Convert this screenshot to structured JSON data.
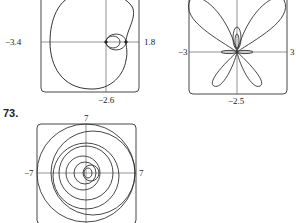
{
  "figures": [
    {
      "id": "cardioid-plot",
      "labels": {
        "left": "−3.4",
        "right": "1.8",
        "bottom": "−2.6"
      }
    },
    {
      "id": "butterfly-plot",
      "labels": {
        "left": "−3",
        "right": "3",
        "bottom": "−2.5"
      }
    },
    {
      "id": "nested-circles-plot",
      "number": "73.",
      "labels": {
        "top": "7",
        "left": "−7",
        "right": "7"
      }
    }
  ]
}
